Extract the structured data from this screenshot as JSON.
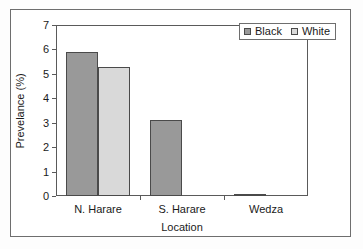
{
  "chart_data": {
    "type": "bar",
    "title": "",
    "xlabel": "Location",
    "ylabel": "Prevelance (%)",
    "categories": [
      "N. Harare",
      "S. Harare",
      "Wedza"
    ],
    "series": [
      {
        "name": "Black",
        "values": [
          5.9,
          3.1,
          0.1
        ],
        "color": "#999999"
      },
      {
        "name": "White",
        "values": [
          5.3,
          0,
          0
        ],
        "color": "#d9d9d9"
      }
    ],
    "ylim": [
      0,
      7
    ],
    "ytick_labels": [
      "0",
      "1",
      "2",
      "3",
      "4",
      "5",
      "6",
      "7"
    ],
    "ytick_values": [
      0,
      1,
      2,
      3,
      4,
      5,
      6,
      7
    ],
    "grid": false,
    "legend_position": "top-right",
    "bar_border_color": "#4a4a4a",
    "axis_color": "#5a5a5a"
  },
  "legend": {
    "entries": [
      {
        "label": "Black",
        "swatch": "black-series-swatch"
      },
      {
        "label": "White",
        "swatch": "white-series-swatch"
      }
    ]
  },
  "axes": {
    "y_title": "Prevelance (%)",
    "x_title": "Location"
  }
}
